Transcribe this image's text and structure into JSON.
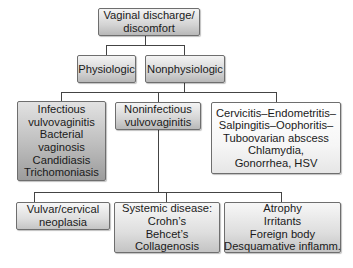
{
  "diagram": {
    "type": "flowchart-tree",
    "root": {
      "lines": [
        "Vaginal discharge/",
        "discomfort"
      ]
    },
    "level1": [
      {
        "id": "physiologic",
        "lines": [
          "Physiologic"
        ]
      },
      {
        "id": "nonphysiologic",
        "lines": [
          "Nonphysiologic"
        ]
      }
    ],
    "level2": [
      {
        "id": "infectious",
        "lines": [
          "Infectious",
          "vulvovaginitis",
          "Bacterial",
          "vaginosis",
          "Candidiasis",
          "Trichomoniasis"
        ]
      },
      {
        "id": "noninfectious",
        "lines": [
          "Noninfectious",
          "vulvovaginitis"
        ]
      },
      {
        "id": "cervicitis",
        "lines": [
          "Cervicitis–Endometritis–",
          "Salpingitis–Oophoritis–",
          "Tuboovarian abscess",
          "Chlamydia,",
          "Gonorrhea, HSV"
        ]
      }
    ],
    "level3": [
      {
        "id": "neoplasia",
        "lines": [
          "Vulvar/cervical",
          "neoplasia"
        ]
      },
      {
        "id": "systemic",
        "lines": [
          "Systemic disease:",
          "Crohn’s",
          "Behcet’s",
          "Collagenosis"
        ]
      },
      {
        "id": "atrophy",
        "lines": [
          "Atrophy",
          "Irritants",
          "Foreign body",
          "Desquamative inflamm."
        ]
      }
    ],
    "colors": {
      "connector": "#444444",
      "box_border": "#6e6e6e",
      "infectious_fill": "#bdbdbd",
      "default_fill": "#dedede"
    }
  }
}
